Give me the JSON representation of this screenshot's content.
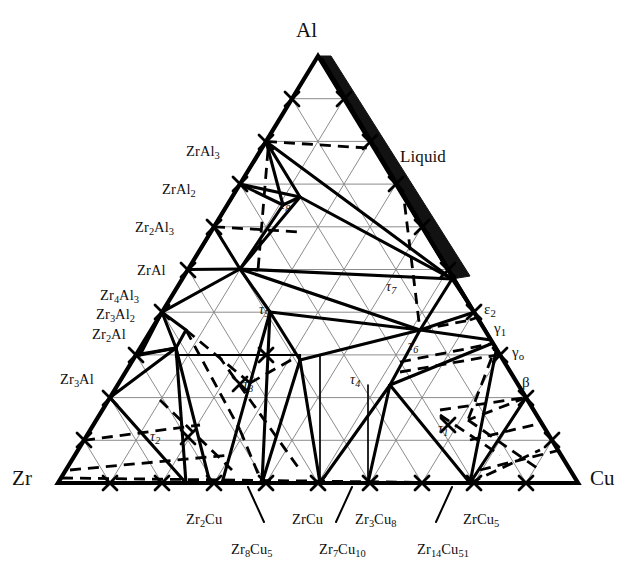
{
  "figure": {
    "type": "ternary-phase-diagram",
    "system": "Al-Zr-Cu",
    "background_color": "#ffffff",
    "ink_color": "#000000",
    "gridline_color": "#8c8c8c"
  },
  "corners": {
    "top": "Al",
    "bottom_left": "Zr",
    "bottom_right": "Cu"
  },
  "region_labels": {
    "liquid": "Liquid"
  },
  "left_axis_phases": [
    {
      "id": "ZrAl3",
      "html": "ZrAl<sub>3</sub>"
    },
    {
      "id": "ZrAl2",
      "html": "ZrAl<sub>2</sub>"
    },
    {
      "id": "Zr2Al3",
      "html": "Zr<sub>2</sub>Al<sub>3</sub>"
    },
    {
      "id": "ZrAl",
      "html": "ZrAl"
    },
    {
      "id": "Zr4Al3",
      "html": "Zr<sub>4</sub>Al<sub>3</sub>"
    },
    {
      "id": "Zr3Al2",
      "html": "Zr<sub>3</sub>Al<sub>2</sub>"
    },
    {
      "id": "Zr2Al",
      "html": "Zr<sub>2</sub>Al"
    },
    {
      "id": "Zr3Al",
      "html": "Zr<sub>3</sub>Al"
    }
  ],
  "right_axis_phases": [
    {
      "id": "epsilon2",
      "html": "ε<sub>2</sub>"
    },
    {
      "id": "gamma1",
      "html": "γ<sub>1</sub>"
    },
    {
      "id": "gamma0",
      "html": "γ<sub>o</sub>"
    },
    {
      "id": "beta",
      "html": "β"
    }
  ],
  "bottom_axis_phases": [
    {
      "id": "Zr2Cu",
      "html": "Zr<sub>2</sub>Cu"
    },
    {
      "id": "Zr8Cu5",
      "html": "Zr<sub>8</sub>Cu<sub>5</sub>"
    },
    {
      "id": "ZrCu",
      "html": "ZrCu"
    },
    {
      "id": "Zr7Cu10",
      "html": "Zr<sub>7</sub>Cu<sub>10</sub>"
    },
    {
      "id": "Zr3Cu8",
      "html": "Zr<sub>3</sub>Cu<sub>8</sub>"
    },
    {
      "id": "Zr14Cu51",
      "html": "Zr<sub>14</sub>Cu<sub>51</sub>"
    },
    {
      "id": "ZrCu5",
      "html": "ZrCu<sub>5</sub>"
    }
  ],
  "ternary_phases": [
    {
      "id": "tau1",
      "html": "τ<sub>1</sub>"
    },
    {
      "id": "tau2",
      "html": "τ<sub>2</sub>"
    },
    {
      "id": "tau3",
      "html": "τ<sub>3</sub>"
    },
    {
      "id": "tau4",
      "html": "τ<sub>4</sub>"
    },
    {
      "id": "tau5",
      "html": "τ<sub>5</sub>"
    },
    {
      "id": "tau6",
      "html": "τ<sub>6</sub>"
    },
    {
      "id": "tau7",
      "html": "τ<sub>7</sub>"
    },
    {
      "id": "tau8",
      "html": "τ<sub>8</sub>"
    }
  ],
  "chart_data": {
    "type": "ternary-phase-diagram",
    "title": "",
    "components": [
      "Al",
      "Zr",
      "Cu"
    ],
    "grid": {
      "divisions": 10,
      "shown": true,
      "color": "#8c8c8c"
    },
    "axis_ticks": {
      "count_per_edge": 10,
      "style": "x-cross"
    },
    "triangle_px": {
      "apex": [
        318,
        56
      ],
      "left": [
        58,
        483
      ],
      "right": [
        578,
        483
      ]
    },
    "phase_points": [
      {
        "label": "ZrAl3",
        "al": 0.75,
        "zr": 0.25,
        "cu": 0.0
      },
      {
        "label": "ZrAl2",
        "al": 0.667,
        "zr": 0.333,
        "cu": 0.0
      },
      {
        "label": "Zr2Al3",
        "al": 0.6,
        "zr": 0.4,
        "cu": 0.0
      },
      {
        "label": "ZrAl",
        "al": 0.5,
        "zr": 0.5,
        "cu": 0.0
      },
      {
        "label": "Zr4Al3",
        "al": 0.43,
        "zr": 0.57,
        "cu": 0.0
      },
      {
        "label": "Zr3Al2",
        "al": 0.4,
        "zr": 0.6,
        "cu": 0.0
      },
      {
        "label": "Zr2Al",
        "al": 0.333,
        "zr": 0.667,
        "cu": 0.0
      },
      {
        "label": "Zr3Al",
        "al": 0.25,
        "zr": 0.75,
        "cu": 0.0
      },
      {
        "label": "Zr2Cu",
        "al": 0.0,
        "zr": 0.667,
        "cu": 0.333
      },
      {
        "label": "Zr8Cu5",
        "al": 0.0,
        "zr": 0.615,
        "cu": 0.385
      },
      {
        "label": "ZrCu",
        "al": 0.0,
        "zr": 0.5,
        "cu": 0.5
      },
      {
        "label": "Zr7Cu10",
        "al": 0.0,
        "zr": 0.41,
        "cu": 0.59
      },
      {
        "label": "Zr3Cu8",
        "al": 0.0,
        "zr": 0.27,
        "cu": 0.73
      },
      {
        "label": "Zr14Cu51",
        "al": 0.0,
        "zr": 0.215,
        "cu": 0.785
      },
      {
        "label": "ZrCu5",
        "al": 0.0,
        "zr": 0.167,
        "cu": 0.833
      },
      {
        "label": "epsilon2",
        "al": 0.4,
        "zr": 0.0,
        "cu": 0.6
      },
      {
        "label": "gamma1",
        "al": 0.36,
        "zr": 0.0,
        "cu": 0.64
      },
      {
        "label": "gamma0",
        "al": 0.32,
        "zr": 0.0,
        "cu": 0.68
      },
      {
        "label": "beta",
        "al": 0.2,
        "zr": 0.0,
        "cu": 0.8
      },
      {
        "label": "tau1",
        "al": 0.17,
        "zr": 0.15,
        "cu": 0.68
      },
      {
        "label": "tau2",
        "al": 0.12,
        "zr": 0.7,
        "cu": 0.18
      },
      {
        "label": "tau3",
        "al": 0.32,
        "zr": 0.41,
        "cu": 0.27
      },
      {
        "label": "tau4",
        "al": 0.33,
        "zr": 0.25,
        "cu": 0.42
      },
      {
        "label": "tau5",
        "al": 0.46,
        "zr": 0.37,
        "cu": 0.17
      },
      {
        "label": "tau6",
        "al": 0.43,
        "zr": 0.1,
        "cu": 0.47
      },
      {
        "label": "tau7",
        "al": 0.58,
        "zr": 0.08,
        "cu": 0.34
      },
      {
        "label": "tau8",
        "al": 0.69,
        "zr": 0.22,
        "cu": 0.09
      }
    ]
  }
}
